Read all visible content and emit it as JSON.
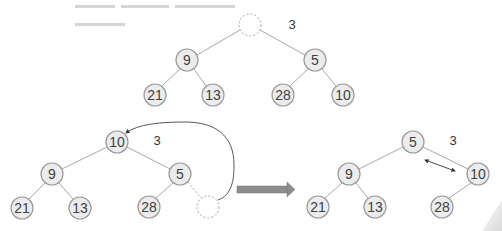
{
  "diagram": {
    "colors": {
      "node_fill": "#ececec",
      "node_stroke": "#9a9a9a",
      "edge": "#a8a8a8",
      "text": "#404040",
      "block_arrow": "#8c8c8c"
    },
    "top_tree": {
      "removed_value_label": "3",
      "root": {
        "x": 250,
        "y": 25,
        "label": "",
        "empty": true
      },
      "nodes": [
        {
          "id": "t9",
          "x": 187,
          "y": 60,
          "label": "9"
        },
        {
          "id": "t5",
          "x": 315,
          "y": 60,
          "label": "5"
        },
        {
          "id": "t21",
          "x": 155,
          "y": 95,
          "label": "21"
        },
        {
          "id": "t13",
          "x": 213,
          "y": 95,
          "label": "13"
        },
        {
          "id": "t28",
          "x": 283,
          "y": 95,
          "label": "28"
        },
        {
          "id": "t10",
          "x": 343,
          "y": 95,
          "label": "10"
        }
      ]
    },
    "bottom_left_tree": {
      "removed_value_label": "3",
      "nodes": [
        {
          "id": "l10",
          "x": 117,
          "y": 142,
          "label": "10"
        },
        {
          "id": "l9",
          "x": 52,
          "y": 174,
          "label": "9"
        },
        {
          "id": "l5",
          "x": 180,
          "y": 174,
          "label": "5"
        },
        {
          "id": "l21",
          "x": 22,
          "y": 208,
          "label": "21"
        },
        {
          "id": "l13",
          "x": 80,
          "y": 208,
          "label": "13"
        },
        {
          "id": "l28",
          "x": 149,
          "y": 207,
          "label": "28"
        }
      ],
      "empty_slot": {
        "x": 208,
        "y": 207
      },
      "move_arrow": "last element moved to root"
    },
    "transition_arrow": "block-arrow-right",
    "bottom_right_tree": {
      "removed_value_label": "3",
      "nodes": [
        {
          "id": "r5",
          "x": 413,
          "y": 142,
          "label": "5"
        },
        {
          "id": "r9",
          "x": 349,
          "y": 174,
          "label": "9"
        },
        {
          "id": "r10",
          "x": 478,
          "y": 174,
          "label": "10"
        },
        {
          "id": "r21",
          "x": 318,
          "y": 207,
          "label": "21"
        },
        {
          "id": "r13",
          "x": 375,
          "y": 207,
          "label": "13"
        },
        {
          "id": "r28",
          "x": 442,
          "y": 207,
          "label": "28"
        }
      ],
      "swap_arrow": "double-headed swap between 5 and 10"
    }
  }
}
